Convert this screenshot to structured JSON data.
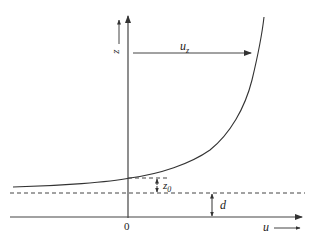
{
  "diagram": {
    "type": "velocity-profile",
    "labels": {
      "z_axis": "z",
      "z_axis_arrow": "arrow-up",
      "u_axis": "u",
      "u_axis_arrow": "arrow-right",
      "origin": "0",
      "uz_base": "u",
      "uz_sub": "z",
      "z0_base": "z",
      "z0_sub": "0",
      "d": "d"
    },
    "colors": {
      "line": "#333333",
      "background": "#ffffff"
    }
  }
}
